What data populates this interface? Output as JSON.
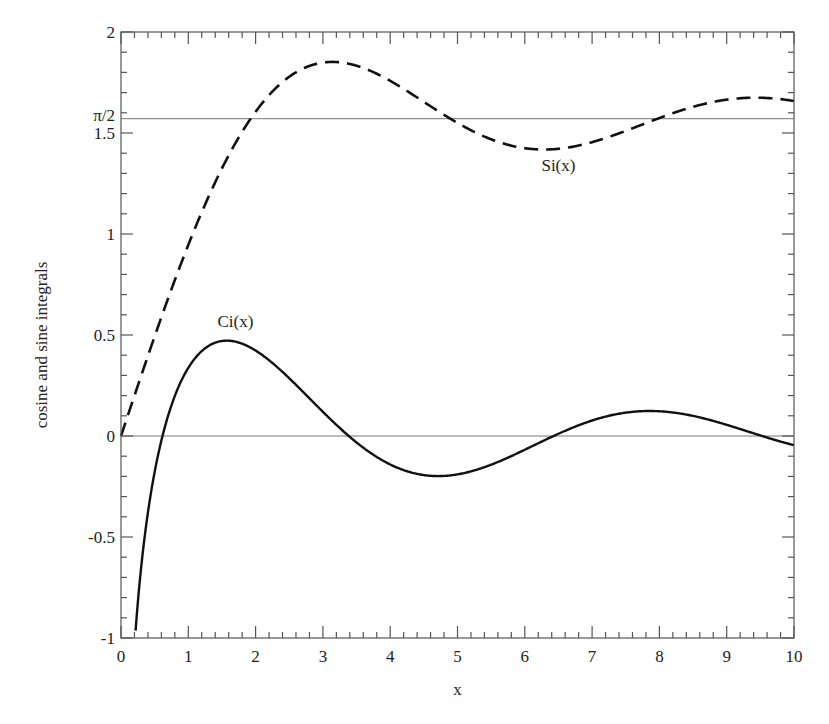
{
  "chart_data": {
    "type": "line",
    "title": "",
    "xlabel": "x",
    "ylabel": "cosine and sine integrals",
    "xlim": [
      0,
      10
    ],
    "ylim": [
      -1,
      2
    ],
    "grid": false,
    "legend": "none (inline curve labels)",
    "x_ticks": [
      0,
      1,
      2,
      3,
      4,
      5,
      6,
      7,
      8,
      9,
      10
    ],
    "x_tick_labels": [
      "0",
      "1",
      "2",
      "3",
      "4",
      "5",
      "6",
      "7",
      "8",
      "9",
      "10"
    ],
    "y_ticks": [
      -1,
      -0.5,
      0,
      0.5,
      1,
      1.5,
      1.5708,
      2
    ],
    "y_tick_labels": [
      "-1",
      "-0.5",
      "0",
      "0.5",
      "1",
      "1.5",
      "π/2",
      "2"
    ],
    "reference_lines": [
      {
        "y": 0,
        "style": "thin solid"
      },
      {
        "y": 1.5708,
        "label": "π/2",
        "style": "thin solid"
      }
    ],
    "annotations": [
      {
        "text": "Si(x)",
        "x": 6.5,
        "y": 1.31
      },
      {
        "text": "Ci(x)",
        "x": 1.7,
        "y": 0.54
      }
    ],
    "series": [
      {
        "name": "Si(x)",
        "style": "dashed",
        "x": [
          0,
          0.5,
          1,
          1.5,
          2,
          2.5,
          3,
          3.1416,
          3.5,
          4,
          4.5,
          5,
          5.5,
          6,
          6.2832,
          6.5,
          7,
          7.5,
          8,
          8.5,
          9,
          9.4248,
          9.5,
          10
        ],
        "values": [
          0,
          0.493,
          0.946,
          1.325,
          1.605,
          1.778,
          1.849,
          1.852,
          1.833,
          1.758,
          1.654,
          1.55,
          1.468,
          1.425,
          1.418,
          1.422,
          1.455,
          1.516,
          1.574,
          1.63,
          1.665,
          1.675,
          1.674,
          1.658
        ]
      },
      {
        "name": "Ci(x)",
        "style": "solid",
        "x": [
          0.2,
          0.3,
          0.5,
          0.75,
          1,
          1.25,
          1.5708,
          2,
          2.5,
          3,
          3.5,
          4,
          4.5,
          4.7124,
          5,
          5.5,
          6,
          6.5,
          7,
          7.5,
          7.854,
          8,
          8.5,
          9,
          9.5,
          10
        ],
        "values": [
          -1.042,
          -0.649,
          -0.178,
          0.179,
          0.337,
          0.431,
          0.472,
          0.423,
          0.286,
          0.12,
          -0.032,
          -0.141,
          -0.191,
          -0.198,
          -0.19,
          -0.138,
          -0.068,
          0.005,
          0.077,
          0.117,
          0.124,
          0.122,
          0.1,
          0.055,
          0.008,
          -0.045
        ]
      }
    ]
  }
}
